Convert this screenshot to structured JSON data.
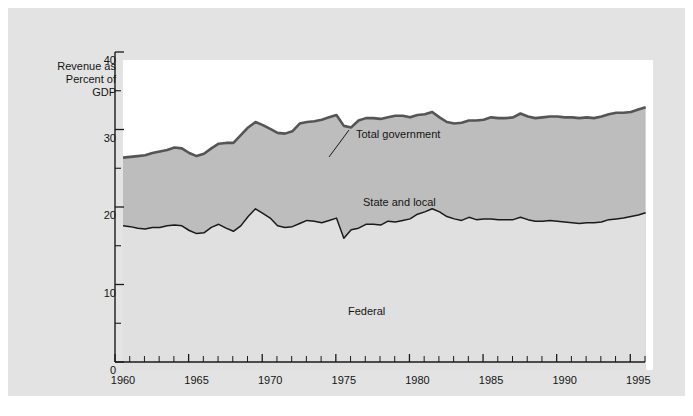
{
  "figure": {
    "axis_title": "Revenue as\nPercent of\nGDP",
    "background_color": "#e3e3e3",
    "plot_background_color": "#ffffff"
  },
  "labels": {
    "total_government": "Total government",
    "state_and_local": "State and local",
    "federal": "Federal"
  },
  "chart_data": {
    "type": "area",
    "title": "",
    "xlabel": "",
    "ylabel": "Revenue as Percent of GDP",
    "xlim": [
      1960,
      1996
    ],
    "ylim": [
      0,
      40
    ],
    "yticks": [
      0,
      10,
      20,
      30,
      40
    ],
    "yticks_minor": [
      5,
      15,
      25,
      35
    ],
    "xticks": [
      1960,
      1965,
      1970,
      1975,
      1980,
      1985,
      1990,
      1995
    ],
    "xticks_minor_step": 1,
    "grid": false,
    "legend_position": "inline-annotations",
    "colors": {
      "total_government_line": "#555555",
      "federal_line": "#1a1a1a",
      "state_and_local_band": "#bdbdbd",
      "federal_band": "#e0e0e0",
      "above_total": "#ffffff"
    },
    "x": [
      1960,
      1960.5,
      1961,
      1961.5,
      1962,
      1962.5,
      1963,
      1963.5,
      1964,
      1964.5,
      1965,
      1965.5,
      1966,
      1966.5,
      1967,
      1967.5,
      1968,
      1968.5,
      1969,
      1969.5,
      1970,
      1970.5,
      1971,
      1971.5,
      1972,
      1972.5,
      1973,
      1973.5,
      1974,
      1974.5,
      1975,
      1975.5,
      1976,
      1976.5,
      1977,
      1977.5,
      1978,
      1978.5,
      1979,
      1979.5,
      1980,
      1980.5,
      1981,
      1981.5,
      1982,
      1982.5,
      1983,
      1983.5,
      1984,
      1984.5,
      1985,
      1985.5,
      1986,
      1986.5,
      1987,
      1987.5,
      1988,
      1988.5,
      1989,
      1989.5,
      1990,
      1990.5,
      1991,
      1991.5,
      1992,
      1992.5,
      1993,
      1993.5,
      1994,
      1994.5,
      1995,
      1995.5
    ],
    "series": [
      {
        "name": "Total government",
        "values": [
          27.4,
          27.5,
          27.6,
          27.7,
          28.0,
          28.2,
          28.4,
          28.7,
          28.6,
          28.0,
          27.6,
          27.9,
          28.6,
          29.2,
          29.3,
          29.3,
          30.3,
          31.3,
          32.0,
          31.6,
          31.1,
          30.6,
          30.5,
          30.8,
          31.8,
          32.0,
          32.1,
          32.3,
          32.6,
          32.9,
          31.5,
          31.3,
          32.2,
          32.5,
          32.5,
          32.4,
          32.6,
          32.8,
          32.8,
          32.6,
          32.9,
          33.0,
          33.3,
          32.6,
          32.0,
          31.8,
          31.9,
          32.2,
          32.2,
          32.3,
          32.6,
          32.5,
          32.5,
          32.6,
          33.1,
          32.7,
          32.5,
          32.6,
          32.7,
          32.7,
          32.6,
          32.6,
          32.5,
          32.6,
          32.5,
          32.7,
          33.0,
          33.2,
          33.2,
          33.3,
          33.6,
          33.9
        ]
      },
      {
        "name": "Federal",
        "values": [
          18.6,
          18.5,
          18.3,
          18.2,
          18.4,
          18.4,
          18.6,
          18.7,
          18.6,
          18.0,
          17.6,
          17.7,
          18.4,
          18.8,
          18.3,
          17.9,
          18.6,
          19.8,
          20.8,
          20.2,
          19.6,
          18.6,
          18.4,
          18.5,
          18.9,
          19.3,
          19.2,
          19.0,
          19.3,
          19.6,
          17.0,
          18.1,
          18.3,
          18.8,
          18.8,
          18.7,
          19.2,
          19.1,
          19.3,
          19.5,
          20.1,
          20.4,
          20.8,
          20.4,
          19.8,
          19.5,
          19.3,
          19.7,
          19.4,
          19.5,
          19.5,
          19.4,
          19.4,
          19.4,
          19.7,
          19.4,
          19.2,
          19.2,
          19.3,
          19.2,
          19.1,
          19.0,
          18.9,
          19.0,
          19.0,
          19.1,
          19.4,
          19.5,
          19.6,
          19.8,
          20.0,
          20.3
        ]
      }
    ]
  }
}
